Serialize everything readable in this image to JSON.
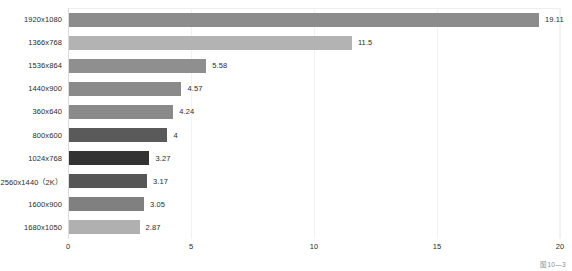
{
  "chart_data": {
    "type": "bar",
    "orientation": "horizontal",
    "title": "",
    "xlabel": "",
    "ylabel": "",
    "xlim": [
      0,
      20
    ],
    "xticks": [
      "0",
      "5",
      "10",
      "15",
      "20"
    ],
    "grid": true,
    "legend": false,
    "categories": [
      "1920x1080",
      "1366x768",
      "1536x864",
      "1440x900",
      "360x640",
      "800x600",
      "1024x768",
      "2560x1440（2K）",
      "1600x900",
      "1680x1050"
    ],
    "values": [
      19.11,
      11.5,
      5.58,
      4.57,
      4.24,
      4,
      3.27,
      3.17,
      3.05,
      2.87
    ],
    "value_labels": [
      "19.11",
      "11.5",
      "5.58",
      "4.57",
      "4.24",
      "4",
      "3.27",
      "3.17",
      "3.05",
      "2.87"
    ],
    "bar_colors": [
      "#8c8c8c",
      "#b3b3b3",
      "#8f8f8f",
      "#8a8a8a",
      "#8a8a8a",
      "#5a5a5a",
      "#333333",
      "#565656",
      "#808080",
      "#b0b0b0"
    ]
  },
  "caption": "图10—3"
}
